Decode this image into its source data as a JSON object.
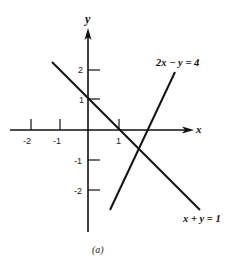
{
  "figure": {
    "caption": "(a)",
    "axes": {
      "x_label": "x",
      "y_label": "y",
      "x_ticks": [
        "-2",
        "-1",
        "1"
      ],
      "y_ticks": [
        "2",
        "1",
        "-1",
        "-2"
      ]
    },
    "lines": [
      {
        "equation": "2x − y = 4",
        "slope": 2,
        "intercept": -4
      },
      {
        "equation": "x + y = 1",
        "slope": -1,
        "intercept": 1
      }
    ],
    "intersection": {
      "x": "5/3",
      "y": "-2/3"
    }
  }
}
